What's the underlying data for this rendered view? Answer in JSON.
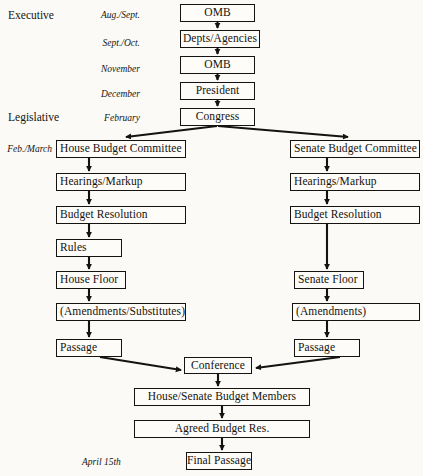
{
  "diagram": {
    "type": "flowchart",
    "background_color": "#fbfaf7",
    "line_color": "#14130f"
  },
  "branch_labels": [
    {
      "id": "executive",
      "text": "Executive",
      "x": 8,
      "y": 9
    },
    {
      "id": "legislative",
      "text": "Legislative",
      "x": 8,
      "y": 111
    }
  ],
  "period_labels": [
    {
      "id": "aug-sept",
      "text": "Aug./Sept.",
      "x": 84,
      "y": 9
    },
    {
      "id": "sept-oct",
      "text": "Sept./Oct.",
      "x": 84,
      "y": 37
    },
    {
      "id": "november",
      "text": "November",
      "x": 84,
      "y": 64
    },
    {
      "id": "december",
      "text": "December",
      "x": 84,
      "y": 88
    },
    {
      "id": "february",
      "text": "February",
      "x": 84,
      "y": 112
    },
    {
      "id": "feb-march",
      "text": "Feb./March",
      "x": 2,
      "y": 143
    },
    {
      "id": "april-15th",
      "text": "April 15th",
      "x": 82,
      "y": 458
    }
  ],
  "nodes": [
    {
      "id": "omb-1",
      "text": "OMB",
      "x": 180,
      "y": 4,
      "w": 75,
      "h": 18,
      "align": "center"
    },
    {
      "id": "depts-agencies",
      "text": "Depts/Agencies",
      "x": 180,
      "y": 30,
      "w": 80,
      "h": 18,
      "align": "center"
    },
    {
      "id": "omb-2",
      "text": "OMB",
      "x": 180,
      "y": 56,
      "w": 75,
      "h": 18,
      "align": "center"
    },
    {
      "id": "president",
      "text": "President",
      "x": 180,
      "y": 82,
      "w": 75,
      "h": 18,
      "align": "center"
    },
    {
      "id": "congress",
      "text": "Congress",
      "x": 180,
      "y": 108,
      "w": 75,
      "h": 18,
      "align": "center"
    },
    {
      "id": "house-budget-committee",
      "text": "House Budget Committee",
      "x": 56,
      "y": 140,
      "w": 130,
      "h": 18,
      "align": "left"
    },
    {
      "id": "senate-budget-committee",
      "text": "Senate Budget Committee",
      "x": 290,
      "y": 140,
      "w": 130,
      "h": 18,
      "align": "left"
    },
    {
      "id": "house-hearings-markup",
      "text": "Hearings/Markup",
      "x": 56,
      "y": 173,
      "w": 130,
      "h": 18,
      "align": "left"
    },
    {
      "id": "senate-hearings-markup",
      "text": "Hearings/Markup",
      "x": 290,
      "y": 173,
      "w": 130,
      "h": 18,
      "align": "left"
    },
    {
      "id": "house-budget-resolution",
      "text": "Budget Resolution",
      "x": 56,
      "y": 206,
      "w": 130,
      "h": 18,
      "align": "left"
    },
    {
      "id": "senate-budget-resolution",
      "text": "Budget Resolution",
      "x": 290,
      "y": 206,
      "w": 130,
      "h": 18,
      "align": "left"
    },
    {
      "id": "rules",
      "text": "Rules",
      "x": 56,
      "y": 239,
      "w": 66,
      "h": 18,
      "align": "left"
    },
    {
      "id": "house-floor",
      "text": "House Floor",
      "x": 56,
      "y": 271,
      "w": 70,
      "h": 18,
      "align": "left"
    },
    {
      "id": "senate-floor",
      "text": "Senate Floor",
      "x": 294,
      "y": 271,
      "w": 70,
      "h": 18,
      "align": "left"
    },
    {
      "id": "house-amendments",
      "text": "(Amendments/Substitutes)",
      "x": 56,
      "y": 303,
      "w": 130,
      "h": 18,
      "align": "left"
    },
    {
      "id": "senate-amendments",
      "text": "(Amendments)",
      "x": 292,
      "y": 303,
      "w": 128,
      "h": 18,
      "align": "left"
    },
    {
      "id": "house-passage",
      "text": "Passage",
      "x": 56,
      "y": 339,
      "w": 66,
      "h": 18,
      "align": "left"
    },
    {
      "id": "senate-passage",
      "text": "Passage",
      "x": 294,
      "y": 339,
      "w": 66,
      "h": 18,
      "align": "left"
    },
    {
      "id": "conference",
      "text": "Conference",
      "x": 184,
      "y": 357,
      "w": 68,
      "h": 17,
      "align": "center"
    },
    {
      "id": "house-senate-budget-members",
      "text": "House/Senate Budget Members",
      "x": 134,
      "y": 388,
      "w": 176,
      "h": 18,
      "align": "center"
    },
    {
      "id": "agreed-budget-res",
      "text": "Agreed Budget Res.",
      "x": 134,
      "y": 420,
      "w": 176,
      "h": 18,
      "align": "center"
    },
    {
      "id": "final-passage",
      "text": "Final Passage",
      "x": 186,
      "y": 452,
      "w": 66,
      "h": 18,
      "align": "center"
    }
  ],
  "flow_sequence": {
    "executive": [
      "OMB",
      "Depts/Agencies",
      "OMB",
      "President",
      "Congress"
    ],
    "house_chamber": [
      "House Budget Committee",
      "Hearings/Markup",
      "Budget Resolution",
      "Rules",
      "House Floor",
      "(Amendments/Substitutes)",
      "Passage"
    ],
    "senate_chamber": [
      "Senate Budget Committee",
      "Hearings/Markup",
      "Budget Resolution",
      "Senate Floor",
      "(Amendments)",
      "Passage"
    ],
    "joint": [
      "Conference",
      "House/Senate Budget Members",
      "Agreed Budget Res.",
      "Final Passage"
    ]
  }
}
